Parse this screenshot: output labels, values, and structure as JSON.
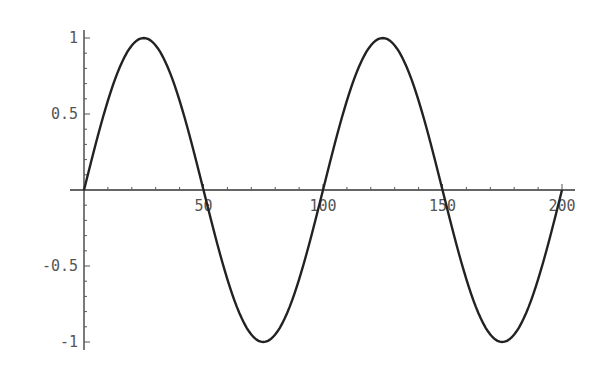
{
  "chart_data": {
    "type": "line",
    "title": "",
    "xlabel": "",
    "ylabel": "",
    "xlim": [
      0,
      205
    ],
    "ylim": [
      -1,
      1
    ],
    "grid": false,
    "x_ticks": [
      50,
      100,
      150,
      200
    ],
    "x_tick_labels": [
      "50",
      "100",
      "150",
      "200"
    ],
    "y_ticks": [
      -1,
      -0.5,
      0.5,
      1
    ],
    "y_tick_labels": [
      "-1",
      "-0.5",
      "0.5",
      "1"
    ],
    "series": [
      {
        "name": "sin(2*pi*x/100)",
        "x": [
          0,
          12.5,
          25,
          37.5,
          50,
          62.5,
          75,
          87.5,
          100,
          112.5,
          125,
          137.5,
          150,
          162.5,
          175,
          187.5,
          200
        ],
        "values": [
          0,
          0.707,
          1,
          0.707,
          0,
          -0.707,
          -1,
          -0.707,
          0,
          0.707,
          1,
          0.707,
          0,
          -0.707,
          -1,
          -0.707,
          0
        ]
      }
    ],
    "color": "#222222"
  }
}
